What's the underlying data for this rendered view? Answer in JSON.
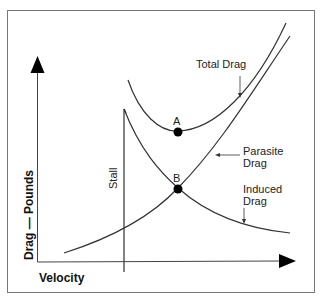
{
  "diagram": {
    "title": "",
    "x_axis_label": "Velocity",
    "y_axis_label": "Drag — Pounds",
    "curves": [
      {
        "name": "total-drag",
        "label": "Total Drag"
      },
      {
        "name": "parasite-drag",
        "label_line1": "Parasite",
        "label_line2": "Drag"
      },
      {
        "name": "induced-drag",
        "label_line1": "Induced",
        "label_line2": "Drag"
      }
    ],
    "points": [
      {
        "name": "A",
        "label": "A"
      },
      {
        "name": "B",
        "label": "B"
      }
    ],
    "stall_label": "Stall",
    "colors": {
      "line": "#222222",
      "border": "#666666",
      "background": "#ffffff"
    }
  }
}
